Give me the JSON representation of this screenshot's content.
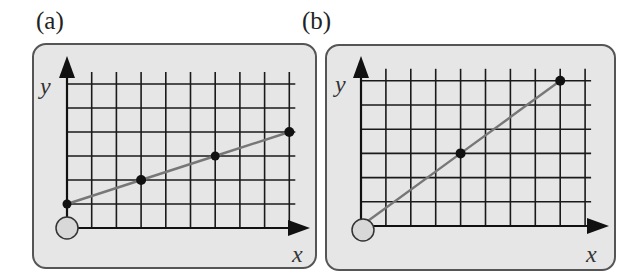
{
  "panels": [
    {
      "id": "a",
      "label": "(a)",
      "x_axis_label": "x",
      "y_axis_label": "y",
      "grid": {
        "columns": 9,
        "rows": 6
      },
      "origin_marker": "open-circle",
      "line_color": "#777777",
      "points": [
        {
          "gx": 0,
          "gy": 1
        },
        {
          "gx": 3,
          "gy": 2
        },
        {
          "gx": 6,
          "gy": 3
        },
        {
          "gx": 9,
          "gy": 4
        }
      ]
    },
    {
      "id": "b",
      "label": "(b)",
      "x_axis_label": "x",
      "y_axis_label": "y",
      "grid": {
        "columns": 9,
        "rows": 6
      },
      "origin_marker": "open-circle",
      "line_color": "#777777",
      "points": [
        {
          "gx": 0,
          "gy": 0
        },
        {
          "gx": 4,
          "gy": 3
        },
        {
          "gx": 8,
          "gy": 6
        }
      ]
    }
  ],
  "chart_data": [
    {
      "type": "line",
      "title": "(a)",
      "xlabel": "x",
      "ylabel": "y",
      "x": [
        0,
        3,
        6,
        9
      ],
      "y": [
        1,
        2,
        3,
        4
      ],
      "grid": true,
      "xlim": [
        0,
        9
      ],
      "ylim": [
        0,
        6
      ]
    },
    {
      "type": "line",
      "title": "(b)",
      "xlabel": "x",
      "ylabel": "y",
      "x": [
        0,
        4,
        8
      ],
      "y": [
        0,
        3,
        6
      ],
      "grid": true,
      "xlim": [
        0,
        9
      ],
      "ylim": [
        0,
        6
      ]
    }
  ]
}
